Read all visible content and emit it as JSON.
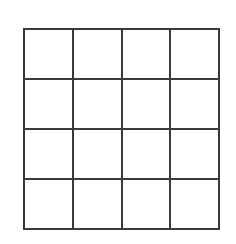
{
  "figure": {
    "name": "blank-4x4-grid",
    "background_color": "#ffffff",
    "line_color": "#3a3a3a",
    "cell_fill_color": "#ffffff",
    "line_width_px": 2,
    "rows": 4,
    "columns": 4,
    "origin_x_px": 24,
    "origin_y_px": 29,
    "width_px": 195,
    "height_px": 200,
    "cell_width_px": 48.75,
    "cell_height_px": 50,
    "vertical_line_x_px": [
      0,
      48.75,
      97.5,
      146.25,
      195
    ],
    "horizontal_line_y_px": [
      0,
      50,
      100,
      150,
      200
    ],
    "cells": [
      {
        "row": 1,
        "column": 1,
        "label": ""
      },
      {
        "row": 1,
        "column": 2,
        "label": ""
      },
      {
        "row": 1,
        "column": 3,
        "label": ""
      },
      {
        "row": 1,
        "column": 4,
        "label": ""
      },
      {
        "row": 2,
        "column": 1,
        "label": ""
      },
      {
        "row": 2,
        "column": 2,
        "label": ""
      },
      {
        "row": 2,
        "column": 3,
        "label": ""
      },
      {
        "row": 2,
        "column": 4,
        "label": ""
      },
      {
        "row": 3,
        "column": 1,
        "label": ""
      },
      {
        "row": 3,
        "column": 2,
        "label": ""
      },
      {
        "row": 3,
        "column": 3,
        "label": ""
      },
      {
        "row": 3,
        "column": 4,
        "label": ""
      },
      {
        "row": 4,
        "column": 1,
        "label": ""
      },
      {
        "row": 4,
        "column": 2,
        "label": ""
      },
      {
        "row": 4,
        "column": 3,
        "label": ""
      },
      {
        "row": 4,
        "column": 4,
        "label": ""
      }
    ]
  }
}
